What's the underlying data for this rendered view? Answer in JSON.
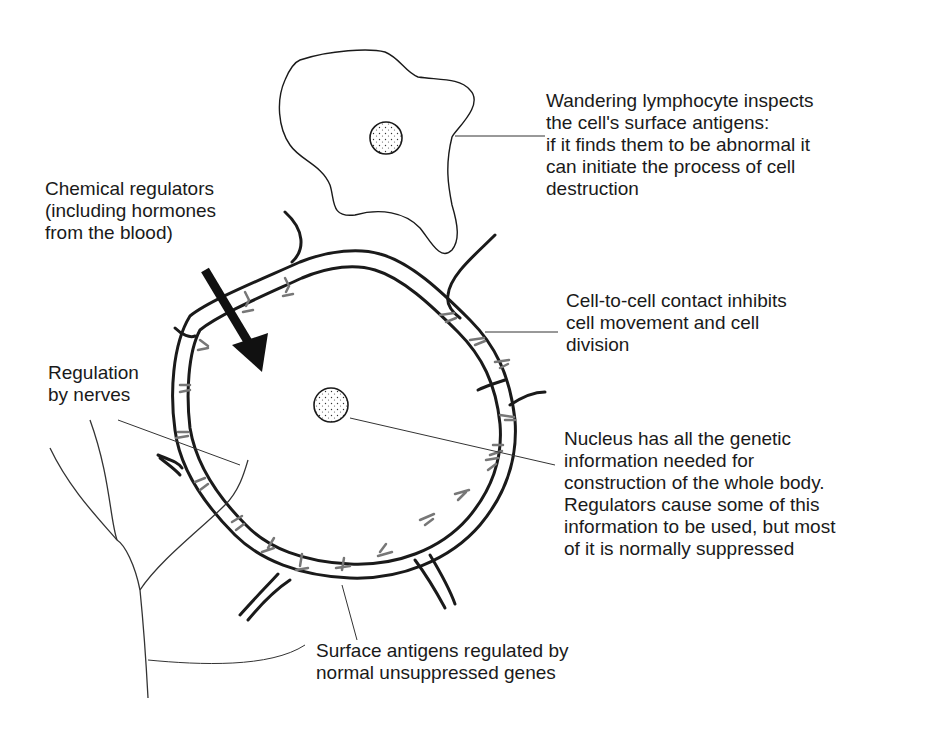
{
  "diagram": {
    "type": "biology-cell-regulation",
    "colors": {
      "ink": "#1a1a1a",
      "antigen": "#777777",
      "background": "#ffffff"
    },
    "labels": {
      "lymphocyte": {
        "lines": [
          "Wandering lymphocyte inspects",
          "the cell's surface antigens:",
          "if it finds them to be abnormal it",
          "can initiate the process of cell",
          "destruction"
        ]
      },
      "chemical_regulators": {
        "lines": [
          "Chemical regulators",
          "(including hormones",
          "from the blood)"
        ]
      },
      "contact_inhibition": {
        "lines": [
          "Cell-to-cell contact inhibits",
          "cell movement and cell",
          "division"
        ]
      },
      "nerves": {
        "lines": [
          "Regulation",
          "by nerves"
        ]
      },
      "nucleus": {
        "lines": [
          "Nucleus has all the genetic",
          "information needed for",
          "construction of the whole body.",
          "Regulators cause some of this",
          "information to be used, but most",
          "of it is normally suppressed"
        ]
      },
      "surface_antigens": {
        "lines": [
          "Surface antigens regulated by",
          "normal unsuppressed genes"
        ]
      }
    },
    "elements": {
      "lymphocyte": "wandering-lymphocyte-cell",
      "cell": "central-body-cell",
      "nucleus": "stippled-nucleus",
      "arrow": "chemical-regulator-arrow",
      "nerve": "branching-nerve-fibre"
    }
  }
}
